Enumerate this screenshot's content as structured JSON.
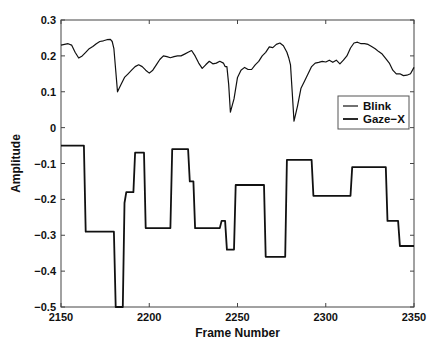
{
  "chart_data": {
    "type": "line",
    "title": "",
    "xlabel": "Frame Number",
    "ylabel": "Amplitude",
    "xlim": [
      2150,
      2350
    ],
    "ylim": [
      -0.5,
      0.3
    ],
    "x_ticks": [
      2150,
      2200,
      2250,
      2300,
      2350
    ],
    "x_tick_labels": [
      "2150",
      "2200",
      "2250",
      "2300",
      "2350"
    ],
    "y_ticks": [
      -0.5,
      -0.4,
      -0.3,
      -0.2,
      -0.1,
      0,
      0.1,
      0.2,
      0.3
    ],
    "y_tick_labels": [
      "−0.5",
      "−0.4",
      "−0.3",
      "−0.2",
      "−0.1",
      "0",
      "0.1",
      "0.2",
      "0.3"
    ],
    "grid": false,
    "legend_position": "right, inside plot near y=0.1",
    "legend": [
      "Blink",
      "Gaze−X"
    ],
    "series": [
      {
        "name": "Blink",
        "style": "thin solid black",
        "x": [
          2150,
          2152,
          2154,
          2156,
          2158,
          2160,
          2162,
          2164,
          2166,
          2168,
          2170,
          2172,
          2174,
          2176,
          2178,
          2179,
          2180,
          2181,
          2182,
          2184,
          2186,
          2188,
          2190,
          2192,
          2194,
          2196,
          2198,
          2200,
          2202,
          2204,
          2206,
          2208,
          2210,
          2212,
          2214,
          2216,
          2218,
          2220,
          2222,
          2224,
          2226,
          2228,
          2230,
          2232,
          2234,
          2236,
          2238,
          2240,
          2242,
          2243,
          2244,
          2245,
          2246,
          2248,
          2250,
          2252,
          2254,
          2256,
          2258,
          2260,
          2262,
          2264,
          2266,
          2268,
          2270,
          2272,
          2274,
          2276,
          2278,
          2279,
          2280,
          2281,
          2282,
          2284,
          2286,
          2288,
          2290,
          2292,
          2294,
          2296,
          2298,
          2300,
          2302,
          2304,
          2306,
          2308,
          2310,
          2312,
          2314,
          2316,
          2318,
          2320,
          2322,
          2324,
          2326,
          2328,
          2330,
          2332,
          2334,
          2336,
          2338,
          2340,
          2342,
          2344,
          2346,
          2348,
          2350
        ],
        "values": [
          0.23,
          0.232,
          0.234,
          0.23,
          0.21,
          0.194,
          0.2,
          0.21,
          0.22,
          0.226,
          0.234,
          0.24,
          0.242,
          0.245,
          0.246,
          0.24,
          0.22,
          0.16,
          0.1,
          0.12,
          0.14,
          0.15,
          0.16,
          0.17,
          0.175,
          0.17,
          0.16,
          0.152,
          0.16,
          0.175,
          0.19,
          0.2,
          0.198,
          0.195,
          0.198,
          0.2,
          0.2,
          0.205,
          0.21,
          0.215,
          0.2,
          0.18,
          0.165,
          0.175,
          0.185,
          0.178,
          0.18,
          0.185,
          0.18,
          0.17,
          0.17,
          0.12,
          0.043,
          0.08,
          0.14,
          0.16,
          0.168,
          0.162,
          0.162,
          0.175,
          0.185,
          0.2,
          0.21,
          0.225,
          0.223,
          0.232,
          0.236,
          0.228,
          0.21,
          0.195,
          0.175,
          0.1,
          0.018,
          0.06,
          0.11,
          0.13,
          0.15,
          0.17,
          0.18,
          0.182,
          0.185,
          0.183,
          0.188,
          0.182,
          0.188,
          0.178,
          0.188,
          0.2,
          0.222,
          0.236,
          0.238,
          0.234,
          0.234,
          0.232,
          0.226,
          0.22,
          0.212,
          0.205,
          0.192,
          0.18,
          0.16,
          0.15,
          0.15,
          0.145,
          0.146,
          0.15,
          0.168
        ]
      },
      {
        "name": "Gaze−X",
        "style": "thick solid black, step-like",
        "x": [
          2150,
          2163,
          2164,
          2180,
          2181,
          2185,
          2186,
          2187,
          2191,
          2192,
          2197,
          2198,
          2212,
          2213,
          2222,
          2223,
          2225,
          2226,
          2240,
          2241,
          2243,
          2244,
          2248,
          2249,
          2265,
          2266,
          2277,
          2278,
          2292,
          2293,
          2314,
          2315,
          2334,
          2335,
          2341,
          2342,
          2350
        ],
        "values": [
          -0.05,
          -0.05,
          -0.29,
          -0.29,
          -0.5,
          -0.5,
          -0.21,
          -0.18,
          -0.18,
          -0.07,
          -0.07,
          -0.28,
          -0.28,
          -0.06,
          -0.06,
          -0.15,
          -0.15,
          -0.28,
          -0.28,
          -0.26,
          -0.26,
          -0.34,
          -0.34,
          -0.16,
          -0.16,
          -0.36,
          -0.36,
          -0.09,
          -0.09,
          -0.19,
          -0.19,
          -0.11,
          -0.11,
          -0.26,
          -0.26,
          -0.33,
          -0.33
        ]
      }
    ]
  },
  "plot_area": {
    "left": 61,
    "right": 414,
    "top": 20,
    "bottom": 307
  },
  "colors": {
    "line": "#111111",
    "axis": "#333333",
    "background": "#ffffff"
  }
}
